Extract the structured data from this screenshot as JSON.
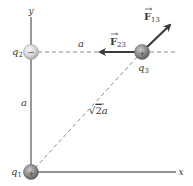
{
  "diagram": {
    "type": "coulomb-force-three-charges",
    "axes": {
      "x_label": "x",
      "y_label": "y"
    },
    "charges": [
      {
        "id": "q1",
        "label": "q",
        "subscript": "1",
        "sign": "+",
        "position": "origin"
      },
      {
        "id": "q2",
        "label": "q",
        "subscript": "2",
        "sign": "−",
        "position": "on y-axis at distance a"
      },
      {
        "id": "q3",
        "label": "q",
        "subscript": "3",
        "sign": "+",
        "position": "at (a, a)"
      }
    ],
    "distances": {
      "horizontal": "a",
      "vertical": "a",
      "diagonal_root": "√",
      "diagonal_rad": "2",
      "diagonal_var": "a"
    },
    "forces": [
      {
        "id": "F23",
        "symbol": "F",
        "subscript": "23",
        "direction": "left"
      },
      {
        "id": "F13",
        "symbol": "F",
        "subscript": "13",
        "direction": "up-right (45°)"
      }
    ],
    "colors": {
      "axis": "#6e6e6e",
      "dashed": "#8a8a8a",
      "arrow": "#3a3a3a",
      "charge_positive": "#8c8c8c",
      "charge_negative": "#d6d6d6",
      "text": "#3a3a3a"
    }
  }
}
